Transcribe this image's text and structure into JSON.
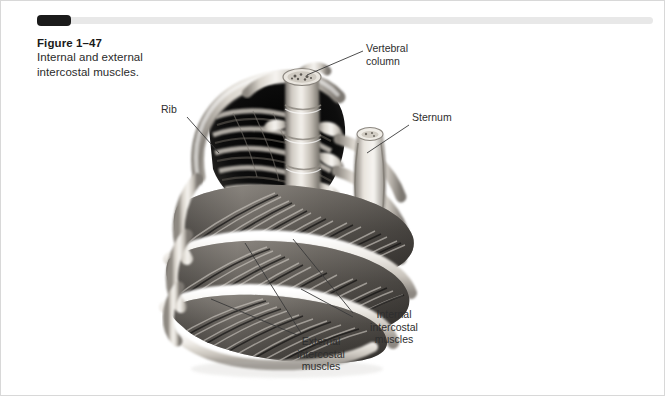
{
  "page": {
    "background": "#ffffff",
    "border_color": "#d8d8d8"
  },
  "rule": {
    "tab_color": "#1b1b1b",
    "line_color": "#e8e8e8"
  },
  "caption": {
    "title": "Figure 1–47",
    "body": "Internal and\nexternal intercostal\nmuscles."
  },
  "figure": {
    "labels": [
      {
        "key": "vertebral",
        "text": "Vertebral\ncolumn"
      },
      {
        "key": "rib",
        "text": "Rib"
      },
      {
        "key": "sternum",
        "text": "Sternum"
      },
      {
        "key": "internal",
        "text": "Internal\nintercostal\nmuscles"
      },
      {
        "key": "external",
        "text": "External\nintercostal\nmuscles"
      }
    ],
    "leader_line_color": "#3a3a3a",
    "illustration_palette": {
      "bone_light": "#f2f0ec",
      "bone_mid": "#cfcac2",
      "bone_shadow": "#8e8a84",
      "muscle_light": "#b9b4ae",
      "muscle_mid": "#6e6a66",
      "muscle_dark": "#2a2826",
      "cavity_dark": "#151515"
    }
  }
}
